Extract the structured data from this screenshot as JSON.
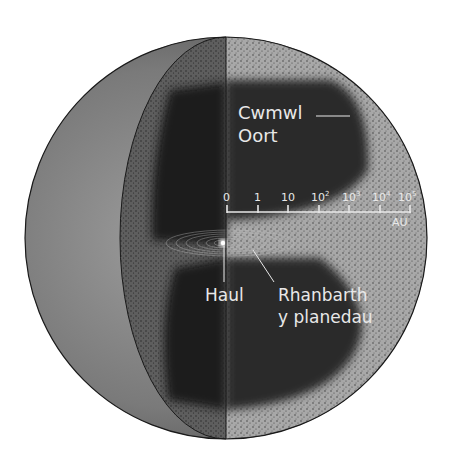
{
  "diagram": {
    "type": "cutaway-sphere",
    "labels": {
      "oort_cloud_line1": "Cwmwl",
      "oort_cloud_line2": "Oort",
      "sun": "Haul",
      "planets_line1": "Rhanbarth",
      "planets_line2": "y planedau"
    },
    "scale": {
      "unit": "AU",
      "ticks": [
        {
          "base": "0",
          "exp": ""
        },
        {
          "base": "1",
          "exp": ""
        },
        {
          "base": "10",
          "exp": ""
        },
        {
          "base": "10",
          "exp": "2"
        },
        {
          "base": "10",
          "exp": "3"
        },
        {
          "base": "10",
          "exp": "4"
        },
        {
          "base": "10",
          "exp": "5"
        }
      ]
    },
    "colors": {
      "background": "#ffffff",
      "outer_shell_dark": "#3a3a3a",
      "outer_shell_light": "#9a9a9a",
      "speckle_region": "#a6a6a6",
      "dark_cloud": "#2b2b2b",
      "text": "#e8e8e8",
      "outline": "#1a1a1a"
    }
  }
}
